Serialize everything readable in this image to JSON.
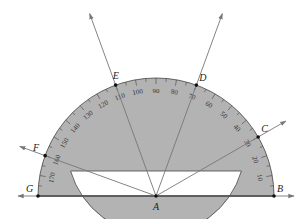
{
  "diagram": {
    "type": "protractor",
    "center": {
      "label": "A",
      "x": 156,
      "y": 196
    },
    "outer_radius": 118,
    "inner_radius": 89,
    "inner_base_y": 171,
    "colors": {
      "band": "#b3b3b3",
      "stroke": "#444444",
      "ray": "#777777",
      "point": "#111111",
      "text": "#222222"
    },
    "scale_labels": [
      "10",
      "20",
      "30",
      "40",
      "50",
      "60",
      "70",
      "80",
      "90",
      "100",
      "110",
      "120",
      "130",
      "140",
      "150",
      "160",
      "170"
    ],
    "points": [
      {
        "label": "B",
        "angle": 0
      },
      {
        "label": "C",
        "angle": 30
      },
      {
        "label": "D",
        "angle": 70
      },
      {
        "label": "E",
        "angle": 110
      },
      {
        "label": "F",
        "angle": 160
      },
      {
        "label": "G",
        "angle": 180
      }
    ],
    "rays": [
      {
        "name": "ray-AB",
        "angle": 0
      },
      {
        "name": "ray-AC",
        "angle": 30
      },
      {
        "name": "ray-AD",
        "angle": 70
      },
      {
        "name": "ray-AE",
        "angle": 110
      },
      {
        "name": "ray-AF",
        "angle": 160
      },
      {
        "name": "ray-AG",
        "angle": 180
      }
    ]
  }
}
